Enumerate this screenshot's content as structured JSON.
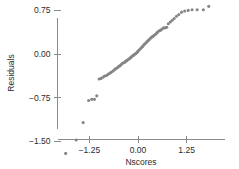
{
  "chart_data": {
    "type": "scatter",
    "title": "",
    "subtitle": "",
    "xlabel": "Nscores",
    "ylabel": "Residuals",
    "xlim": [
      -1.95,
      1.95
    ],
    "ylim": [
      -1.82,
      0.97
    ],
    "xticks": [
      -1.25,
      0.0,
      1.25
    ],
    "xticklabels": [
      "−1.25",
      "0.00",
      "1.25"
    ],
    "yticks": [
      0.75,
      0.0,
      -0.75,
      -1.5
    ],
    "yticklabels": [
      "0.75",
      "0.00",
      "−0.75",
      "−1.50"
    ],
    "grid": false,
    "legend": null,
    "marker": {
      "shape": "circle",
      "color": "#858585",
      "size": 3.1
    },
    "series": [
      {
        "name": "residuals-vs-nscores",
        "x": [
          -1.86,
          -1.59,
          -1.41,
          -1.27,
          -1.19,
          -1.12,
          -1.06,
          -1.0,
          -0.95,
          -0.9,
          -0.86,
          -0.81,
          -0.77,
          -0.73,
          -0.7,
          -0.66,
          -0.62,
          -0.59,
          -0.56,
          -0.52,
          -0.49,
          -0.46,
          -0.43,
          -0.4,
          -0.37,
          -0.34,
          -0.31,
          -0.28,
          -0.25,
          -0.22,
          -0.19,
          -0.17,
          -0.14,
          -0.11,
          -0.08,
          -0.05,
          -0.02,
          0.0,
          0.03,
          0.06,
          0.09,
          0.12,
          0.14,
          0.17,
          0.2,
          0.23,
          0.26,
          0.29,
          0.32,
          0.35,
          0.38,
          0.41,
          0.45,
          0.48,
          0.51,
          0.55,
          0.58,
          0.62,
          0.66,
          0.7,
          0.74,
          0.78,
          0.83,
          0.88,
          0.93,
          0.99,
          1.05,
          1.12,
          1.2,
          1.29,
          1.39,
          1.52,
          1.68,
          1.82
        ],
        "y": [
          -1.71,
          -1.48,
          -1.18,
          -0.8,
          -0.78,
          -0.78,
          -0.72,
          -0.43,
          -0.42,
          -0.4,
          -0.38,
          -0.37,
          -0.35,
          -0.33,
          -0.32,
          -0.3,
          -0.28,
          -0.26,
          -0.25,
          -0.23,
          -0.21,
          -0.2,
          -0.18,
          -0.16,
          -0.15,
          -0.14,
          -0.12,
          -0.11,
          -0.09,
          -0.08,
          -0.06,
          -0.05,
          -0.03,
          -0.02,
          0.0,
          0.01,
          0.03,
          0.05,
          0.07,
          0.09,
          0.11,
          0.13,
          0.15,
          0.17,
          0.19,
          0.21,
          0.23,
          0.25,
          0.27,
          0.29,
          0.3,
          0.32,
          0.34,
          0.36,
          0.38,
          0.4,
          0.41,
          0.43,
          0.45,
          0.45,
          0.46,
          0.52,
          0.55,
          0.58,
          0.61,
          0.65,
          0.68,
          0.72,
          0.74,
          0.75,
          0.76,
          0.76,
          0.76,
          0.82
        ]
      }
    ]
  },
  "axes": {
    "x_title": "Nscores",
    "y_title": "Residuals"
  }
}
